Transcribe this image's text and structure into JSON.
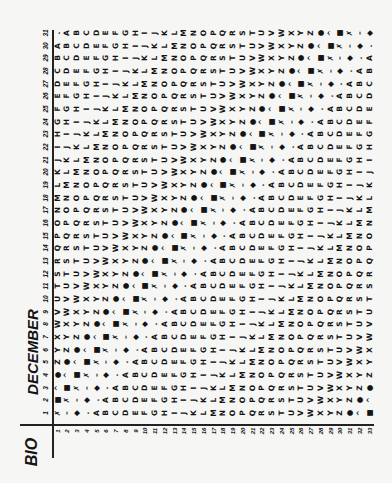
{
  "header": {
    "title": "DECEMBER",
    "label": "BIO"
  },
  "table": {
    "day_numbers": [
      "1",
      "2",
      "3",
      "4",
      "5",
      "6",
      "7",
      "8",
      "9",
      "10",
      "11",
      "12",
      "13",
      "14",
      "15",
      "16",
      "17",
      "18",
      "19",
      "20",
      "21",
      "22",
      "23",
      "24",
      "25",
      "26",
      "27",
      "28",
      "29",
      "30",
      "31"
    ],
    "row_numbers": [
      "1",
      "2",
      "3",
      "4",
      "5",
      "6",
      "7",
      "8",
      "9",
      "10",
      "11",
      "12",
      "13",
      "14",
      "15",
      "16",
      "17",
      "18",
      "19",
      "20",
      "21",
      "22",
      "23",
      "24",
      "25",
      "26",
      "27",
      "28",
      "29",
      "30",
      "31",
      "32",
      "33"
    ],
    "symbol_sequence": "ABCDEFGHIJKLMNOPQRSTUVWXYZ●^■✗–◆.",
    "day_rows": [
      "✗–◆.ABCDEFGHIJKLMNOPQRSTUVWXYZ●^■",
      "■✗–◆.ABCDEFGHIJKLMNOPQRSTUVWXYZ●^",
      "^■✗–◆.ABCDEFGHIJKLMNOPQRSTUVWXYZ●",
      "●^■✗–◆.ABCDEFGHIJKLMNOPQRSTUVWXYZ",
      "Z●^■✗–◆.ABCDEFGHIJKLMNOPQRSTUVWXY",
      "YZ●^■✗–◆.ABCDEFGHIJKLMNOPQRSTUVWX",
      "XYZ●^■✗–◆.ABCDEFGHIJKLMNOPQRSTUVW",
      "WXYZ●^■✗–◆.ABCDEFGHIJKLMNOPQRSTUV",
      "VWXYZ●^■✗–◆.ABCDEFGHIJKLMNOPQRSTU",
      "UVWXYZ●^■✗–◆.ABCDEFGHIJKLMNOPQRST",
      "TUVWXYZ●^■✗–◆.ABCDEFGHIJKLMNOPQRS",
      "STUVWXYZ●^■✗–◆.ABCDEFGHIJKLMNOPQR",
      "RSTUVWXYZ●^■✗–◆.ABCDEFGHIJKLMNOPQ",
      "QRSTUVWXYZ●^■✗–◆.ABCDEFGHIJKLMNOP",
      "PQRSTUVWXYZ●^■✗–◆.ABCDEFGHIJKLMNO",
      "OPQRSTUVWXYZ●^■✗–◆.ABCDEFGHIJKLMN",
      "NOPQRSTUVWXYZ●^■✗–◆.ABCDEFGHIJKLM",
      "MNOPQRSTUVWXYZ●^■✗–◆.ABCDEFGHIJKL",
      "LMNOPQRSTUVWXYZ●^■✗–◆.ABCDEFGHIJK",
      "KLMNOPQRSTUVWXYZ●^■✗–◆.ABCDEFGHIJ",
      "JKLMNOPQRSTUVWXYZ●^■✗–◆.ABCDEFGHI",
      "IJKLMNOPQRSTUVWXYZ●^■✗–◆.ABCDEFGH",
      "HIJKLMNOPQRSTUVWXYZ●^■✗–◆.ABCDEFG",
      "GHIJKLMNOPQRSTUVWXYZ●^■✗–◆.ABCDEF",
      "FGHIJKLMNOPQRSTUVWXYZ●^■✗–◆.ABCDE",
      "EFGHIJKLMNOPQRSTUVWXYZ●^■✗–◆.ABCD",
      "DEFGHIJKLMNOPQRSTUVWXYZ●^■✗–◆.ABC",
      "CDEFGHIJKLMNOPQRSTUVWXYZ●^■✗–◆.AB",
      "BCDEFGHIJKLMNOPQRSTUVWXYZ●^■✗–◆.A",
      "ABCDEFGHIJKLMNOPQRSTUVWXYZ●^■✗–◆.",
      ".ABCDEFGHIJKLMNOPQRSTUVWXYZ●^■✗–◆"
    ]
  },
  "colors": {
    "paper": "#f6f6f4",
    "ink": "#141414"
  }
}
